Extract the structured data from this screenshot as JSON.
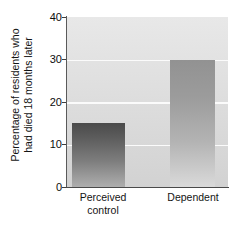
{
  "chart_data": {
    "type": "bar",
    "title": "",
    "xlabel": "",
    "ylabel_lines": [
      "Percentage of residents who",
      "had died 18 months later"
    ],
    "ylabel": "Percentage of residents who had died 18 months later",
    "categories": [
      "Perceived control",
      "Dependent"
    ],
    "category_lines": [
      [
        "Perceived",
        "control"
      ],
      [
        "Dependent"
      ]
    ],
    "values": [
      15,
      30
    ],
    "ylim": [
      0,
      40
    ],
    "yticks": [
      0,
      10,
      20,
      30,
      40
    ],
    "ytick_labels": [
      "0",
      "10",
      "20",
      "30",
      "40"
    ],
    "grid": true,
    "gridlines_at": [
      10,
      20,
      30
    ],
    "legend": null,
    "colors": {
      "bar_perceived_control_top": "#4a4a4a",
      "bar_perceived_control_bottom": "#aeaeae",
      "bar_dependent_top": "#929292",
      "bar_dependent_bottom": "#dadada",
      "plot_background": "#dedede",
      "gridline": "#fbfbfb",
      "axis": "#4a4a4a",
      "text": "#141414"
    }
  }
}
